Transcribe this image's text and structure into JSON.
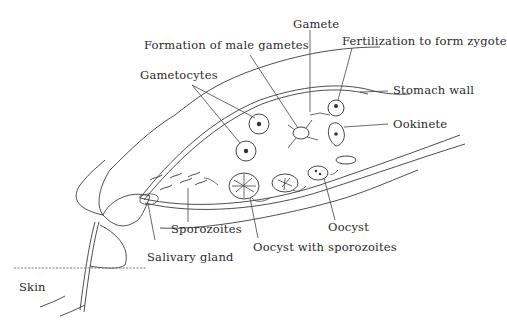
{
  "diagram": {
    "labels": {
      "formation_male_gametes": "Formation of male gametes",
      "gamete": "Gamete",
      "fertilization": "Fertilization to form zygote",
      "gametocytes": "Gametocytes",
      "stomach_wall": "Stomach wall",
      "ookinete": "Ookinete",
      "oocyst": "Oocyst",
      "oocyst_with_sporozoites": "Oocyst with sporozoites",
      "sporozoites": "Sporozoites",
      "salivary_gland": "Salivary gland",
      "skin": "Skin"
    }
  }
}
